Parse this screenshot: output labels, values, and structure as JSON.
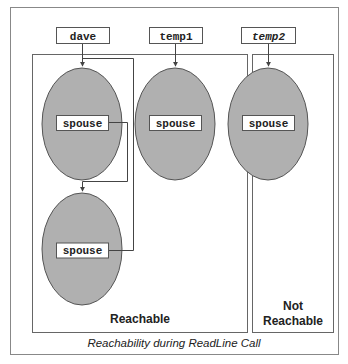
{
  "figure": {
    "caption": "Reachability during ReadLine Call",
    "colors": {
      "ellipse_fill": "#b0b0b0",
      "ellipse_stroke": "#555555",
      "line": "#444444",
      "frame": "#888888",
      "text": "#222222"
    },
    "variables": [
      {
        "label": "dave",
        "italic": false
      },
      {
        "label": "temp1",
        "italic": false
      },
      {
        "label": "temp2",
        "italic": true
      }
    ],
    "objects": [
      {
        "field": "spouse",
        "owner": "dave"
      },
      {
        "field": "spouse",
        "owner": "dave.spouse"
      },
      {
        "field": "spouse",
        "owner": "temp1"
      },
      {
        "field": "spouse",
        "owner": "temp2"
      }
    ],
    "regions": {
      "reachable": "Reachable",
      "not_reachable_line1": "Not",
      "not_reachable_line2": "Reachable"
    }
  }
}
